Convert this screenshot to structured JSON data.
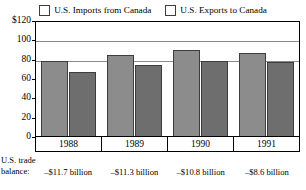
{
  "chart_data": {
    "type": "bar",
    "title": "",
    "xlabel": "",
    "ylabel": "",
    "categories": [
      "1988",
      "1989",
      "1990",
      "1991"
    ],
    "series": [
      {
        "name": "U.S. Imports from Canada",
        "values": [
          78,
          84,
          89,
          86
        ],
        "color": "#8c8c8c"
      },
      {
        "name": "U.S. Exports to Canada",
        "values": [
          66,
          73,
          78,
          77
        ],
        "color": "#6e6e6e"
      }
    ],
    "ylim": [
      0,
      120
    ],
    "yticks": [
      "$120",
      "100",
      "80",
      "60",
      "40",
      "20",
      "0"
    ],
    "ytick_values": [
      120,
      100,
      80,
      60,
      40,
      20,
      0
    ],
    "grid": true,
    "gridlines_at": [
      100,
      80
    ],
    "legend_position": "top-center"
  },
  "legend": {
    "entries": [
      {
        "label": "U.S. Imports from Canada",
        "color": "#8c8c8c"
      },
      {
        "label": "U.S. Exports to Canada",
        "color": "#6e6e6e"
      }
    ]
  },
  "footnote": {
    "label_line1": "U.S. trade",
    "label_line2": "balance:",
    "values": [
      "–$11.7 billion",
      "–$11.3 billion",
      "–$10.8 billion",
      "–$8.6 billion"
    ]
  }
}
